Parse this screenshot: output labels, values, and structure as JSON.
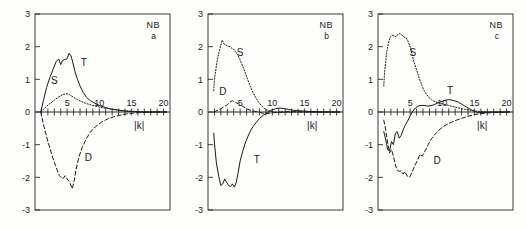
{
  "figure": {
    "panel_count": 3,
    "background_color": "#fdfdfc",
    "line_color": "#1a1a1a"
  },
  "axes": {
    "xlabel": "|k|",
    "ylabel": "",
    "xlim": [
      0,
      21
    ],
    "ylim": [
      -3,
      3
    ],
    "x_tick_labels": [
      "5",
      "10",
      "15",
      "20"
    ],
    "x_tick_values": [
      5,
      10,
      15,
      20
    ],
    "x_minor_tick_step": 1,
    "y_tick_labels": [
      "3",
      "2",
      "1",
      "0",
      "-1",
      "-2",
      "-3"
    ],
    "y_tick_values": [
      3,
      2,
      1,
      0,
      -1,
      -2,
      -3
    ],
    "grid": false,
    "legend_position": "inline-curve-labels"
  },
  "chart_data": [
    {
      "type": "line",
      "title": "NB",
      "subtitle": "a",
      "xlabel": "|k|",
      "ylabel": "",
      "xlim": [
        0,
        21
      ],
      "ylim": [
        -3,
        3
      ],
      "grid": false,
      "corner_label_main": "NB",
      "corner_label_sub": "a",
      "series": [
        {
          "name": "T",
          "label": "T",
          "style": "solid",
          "label_x": 7.6,
          "label_y": 1.4,
          "x": [
            0.9,
            1.3,
            1.8,
            2.3,
            2.8,
            3.3,
            3.7,
            4.0,
            4.3,
            4.6,
            5.0,
            5.3,
            5.6,
            5.9,
            6.2,
            6.6,
            7.0,
            7.5,
            8.0,
            8.6,
            9.2,
            10.0,
            10.8,
            11.6,
            12.5,
            13.5,
            14.5,
            15.5,
            17.0,
            19.0,
            20.5
          ],
          "y": [
            0.0,
            0.35,
            0.75,
            1.05,
            1.3,
            1.55,
            1.62,
            1.45,
            1.58,
            1.6,
            1.63,
            1.8,
            1.72,
            1.5,
            1.25,
            1.0,
            0.8,
            0.6,
            0.45,
            0.35,
            0.28,
            0.2,
            0.15,
            0.1,
            0.07,
            0.04,
            0.02,
            0.01,
            0.0,
            0.0,
            0.0
          ]
        },
        {
          "name": "S",
          "label": "S",
          "style": "dotted",
          "label_x": 3.0,
          "label_y": 0.85,
          "x": [
            0.9,
            1.5,
            2.2,
            3.0,
            3.6,
            4.2,
            4.8,
            5.2,
            5.6,
            6.0,
            6.6,
            7.2,
            8.0,
            8.8,
            9.6,
            10.5,
            11.5,
            12.5,
            13.5,
            14.5,
            16.0,
            18.0,
            20.5
          ],
          "y": [
            0.0,
            0.12,
            0.24,
            0.36,
            0.45,
            0.52,
            0.56,
            0.55,
            0.5,
            0.45,
            0.38,
            0.32,
            0.26,
            0.21,
            0.17,
            0.13,
            0.1,
            0.07,
            0.05,
            0.03,
            0.01,
            0.0,
            0.0
          ]
        },
        {
          "name": "D",
          "label": "D",
          "style": "dashed",
          "label_x": 8.3,
          "label_y": -1.5,
          "x": [
            0.9,
            1.4,
            2.0,
            2.6,
            3.2,
            3.8,
            4.3,
            4.7,
            5.0,
            5.4,
            5.8,
            6.1,
            6.4,
            6.8,
            7.3,
            7.9,
            8.6,
            9.4,
            10.3,
            11.2,
            12.2,
            13.2,
            14.2,
            15.5,
            17.0,
            19.0,
            20.5
          ],
          "y": [
            0.0,
            -0.45,
            -0.9,
            -1.3,
            -1.65,
            -1.95,
            -2.05,
            -1.95,
            -2.05,
            -2.15,
            -2.35,
            -2.1,
            -1.75,
            -1.4,
            -1.1,
            -0.85,
            -0.62,
            -0.45,
            -0.32,
            -0.22,
            -0.15,
            -0.1,
            -0.06,
            -0.03,
            -0.01,
            0.0,
            0.0
          ]
        }
      ]
    },
    {
      "type": "line",
      "title": "NB",
      "subtitle": "b",
      "xlabel": "|k|",
      "ylabel": "",
      "xlim": [
        0,
        21
      ],
      "ylim": [
        -3,
        3
      ],
      "grid": false,
      "corner_label_main": "NB",
      "corner_label_sub": "b",
      "series": [
        {
          "name": "S",
          "label": "S",
          "style": "dotted",
          "label_x": 5.0,
          "label_y": 1.72,
          "x": [
            0.9,
            1.0,
            1.4,
            1.8,
            2.2,
            2.5,
            2.8,
            3.1,
            3.4,
            3.7,
            4.0,
            4.3,
            4.6,
            5.0,
            5.4,
            5.8,
            6.2,
            6.6,
            7.0,
            7.4,
            7.8,
            8.3,
            8.8,
            9.4,
            10.2,
            11.0,
            12.0,
            13.5,
            15.0,
            17.0,
            20.5
          ],
          "y": [
            0.65,
            1.0,
            1.55,
            1.9,
            2.2,
            2.08,
            2.05,
            2.02,
            2.0,
            1.95,
            1.92,
            1.85,
            1.75,
            1.6,
            1.4,
            1.2,
            0.98,
            0.78,
            0.6,
            0.45,
            0.32,
            0.2,
            0.1,
            0.04,
            0.0,
            -0.02,
            -0.01,
            0.0,
            0.0,
            0.0,
            0.0
          ]
        },
        {
          "name": "D",
          "label": "D",
          "style": "dashed",
          "label_x": 2.3,
          "label_y": 0.52,
          "x": [
            0.9,
            1.5,
            2.0,
            2.5,
            3.0,
            3.4,
            3.8,
            4.1,
            4.4,
            4.8,
            5.2,
            5.6,
            6.0,
            6.5,
            7.0,
            7.6,
            8.2,
            8.8,
            9.5,
            10.3,
            11.2,
            12.2,
            13.5,
            15.0,
            17.0,
            20.5
          ],
          "y": [
            0.0,
            0.05,
            0.1,
            0.16,
            0.22,
            0.3,
            0.35,
            0.3,
            0.28,
            0.25,
            0.2,
            0.15,
            0.1,
            0.06,
            0.03,
            0.01,
            -0.02,
            -0.05,
            -0.04,
            -0.02,
            0.0,
            0.02,
            0.01,
            0.0,
            0.0,
            0.0
          ]
        },
        {
          "name": "T",
          "label": "T",
          "style": "solid",
          "label_x": 7.6,
          "label_y": -1.55,
          "x": [
            0.9,
            1.0,
            1.3,
            1.7,
            2.0,
            2.3,
            2.6,
            2.9,
            3.2,
            3.5,
            3.8,
            4.1,
            4.4,
            4.7,
            5.0,
            5.4,
            5.8,
            6.2,
            6.6,
            7.0,
            7.5,
            8.0,
            8.6,
            9.2,
            9.8,
            10.5,
            11.2,
            12.0,
            13.0,
            14.0,
            15.5,
            17.5,
            20.5
          ],
          "y": [
            -0.65,
            -0.95,
            -1.55,
            -2.0,
            -2.25,
            -2.2,
            -2.05,
            -2.15,
            -2.25,
            -2.28,
            -2.2,
            -2.3,
            -2.15,
            -1.85,
            -1.5,
            -1.2,
            -0.95,
            -0.75,
            -0.58,
            -0.45,
            -0.32,
            -0.2,
            -0.1,
            -0.02,
            0.05,
            0.1,
            0.12,
            0.1,
            0.06,
            0.04,
            0.02,
            0.0,
            0.0
          ]
        }
      ]
    },
    {
      "type": "line",
      "title": "NB",
      "subtitle": "c",
      "xlabel": "|k|",
      "ylabel": "",
      "xlim": [
        0,
        21
      ],
      "ylim": [
        -3,
        3
      ],
      "grid": false,
      "corner_label_main": "NB",
      "corner_label_sub": "c",
      "series": [
        {
          "name": "S",
          "label": "S",
          "style": "dotted",
          "label_x": 5.4,
          "label_y": 1.72,
          "x": [
            0.9,
            1.0,
            1.3,
            1.6,
            1.9,
            2.2,
            2.5,
            2.8,
            3.1,
            3.4,
            3.7,
            4.0,
            4.3,
            4.6,
            4.9,
            5.2,
            5.5,
            5.9,
            6.3,
            6.7,
            7.1,
            7.5,
            7.9,
            8.3,
            8.8,
            9.4,
            10.2,
            11.0,
            12.0,
            13.5,
            15.5,
            18.0,
            20.5
          ],
          "y": [
            0.8,
            1.15,
            1.75,
            2.1,
            2.3,
            2.35,
            2.33,
            2.3,
            2.38,
            2.4,
            2.36,
            2.3,
            2.28,
            2.2,
            2.05,
            1.85,
            1.6,
            1.35,
            1.1,
            0.88,
            0.68,
            0.55,
            0.45,
            0.38,
            0.32,
            0.28,
            0.24,
            0.2,
            0.15,
            0.08,
            0.02,
            0.0,
            0.0
          ]
        },
        {
          "name": "T",
          "label": "T",
          "style": "solid",
          "label_x": 11.2,
          "label_y": 0.55,
          "x": [
            0.9,
            1.2,
            1.5,
            1.8,
            2.1,
            2.4,
            2.7,
            3.0,
            3.3,
            3.6,
            3.9,
            4.2,
            4.6,
            5.0,
            5.4,
            5.8,
            6.2,
            6.7,
            7.2,
            7.8,
            8.4,
            9.0,
            9.6,
            10.3,
            11.0,
            11.8,
            12.5,
            13.2,
            13.8,
            14.4,
            15.0,
            15.6,
            16.5,
            18.0,
            20.5
          ],
          "y": [
            -0.6,
            -0.85,
            -1.15,
            -1.2,
            -0.9,
            -1.0,
            -0.65,
            -0.6,
            -0.8,
            -0.72,
            -0.55,
            -0.42,
            -0.28,
            -0.12,
            0.02,
            0.12,
            0.18,
            0.2,
            0.2,
            0.18,
            0.2,
            0.25,
            0.3,
            0.35,
            0.38,
            0.35,
            0.3,
            0.22,
            0.15,
            0.08,
            0.02,
            -0.02,
            -0.02,
            0.0,
            0.0
          ]
        },
        {
          "name": "D",
          "label": "D",
          "style": "dashed",
          "label_x": 9.2,
          "label_y": -1.6,
          "x": [
            0.9,
            1.2,
            1.5,
            1.8,
            2.1,
            2.4,
            2.7,
            3.0,
            3.3,
            3.6,
            3.9,
            4.2,
            4.5,
            4.9,
            5.3,
            5.7,
            6.1,
            6.5,
            6.9,
            7.3,
            7.8,
            8.3,
            8.9,
            9.5,
            10.2,
            11.0,
            11.8,
            12.6,
            13.4,
            14.2,
            15.0,
            16.0,
            17.5,
            20.5
          ],
          "y": [
            -0.25,
            -0.55,
            -0.95,
            -1.25,
            -1.15,
            -1.35,
            -1.62,
            -1.78,
            -1.82,
            -1.8,
            -1.9,
            -1.82,
            -1.95,
            -2.0,
            -1.85,
            -1.65,
            -1.5,
            -1.3,
            -1.35,
            -1.2,
            -1.0,
            -0.82,
            -0.68,
            -0.55,
            -0.44,
            -0.35,
            -0.28,
            -0.22,
            -0.17,
            -0.12,
            -0.08,
            -0.05,
            -0.02,
            0.0
          ]
        }
      ]
    }
  ]
}
